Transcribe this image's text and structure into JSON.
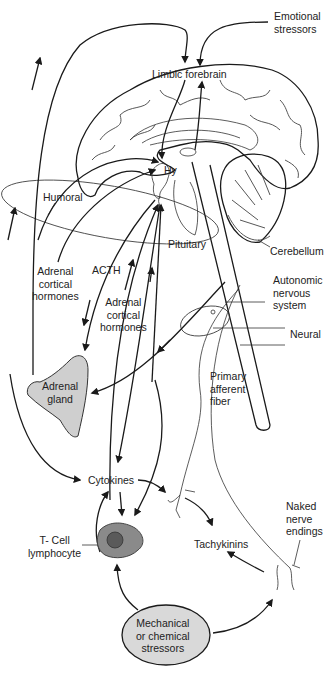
{
  "figure": {
    "type": "neuro-immune interaction diagram",
    "labels": {
      "emotional_stressors": "Emotional\nstressors",
      "limbic_forebrain": "Limbic forebrain",
      "hy": "Hy",
      "humoral": "Humoral",
      "pituitary": "Pituitary",
      "cerebellum": "Cerebellum",
      "adrenal_cortical_hormones_left": "Adrenal\ncortical\nhormones",
      "acth": "ACTH",
      "adrenal_cortical_hormones_center": "Adrenal\ncortical\nhormones",
      "autonomic_nervous_system": "Autonomic\nnervous\nsystem",
      "neural": "Neural",
      "adrenal_gland": "Adrenal\ngland",
      "primary_afferent_fiber": "Primary\nafferent\nfiber",
      "cytokines": "Cytokines",
      "naked_nerve_endings": "Naked\nnerve\nendings",
      "t_cell_lymphocyte": "T- Cell\nlymphocyte",
      "tachykinins": "Tachykinins",
      "mechanical_chemical_stressors": "Mechanical\nor chemical\nstressors"
    },
    "colors": {
      "line": "#1a1a1a",
      "stressor_fill": "#d9d9d9",
      "cell_fill": "#8a8a8a",
      "nucleus_fill": "#5a5a5a",
      "adrenal_fill": "#cfcfcf"
    }
  }
}
